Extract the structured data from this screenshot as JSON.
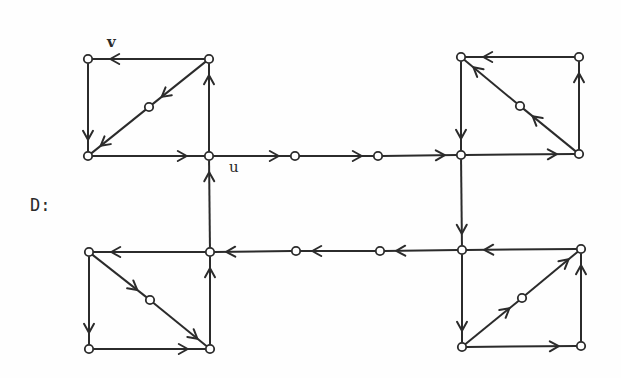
{
  "diagram": {
    "title": "D:",
    "labels": [
      {
        "id": "v",
        "text": "v",
        "x": 107,
        "y": 47
      },
      {
        "id": "u",
        "text": "u",
        "x": 229,
        "y": 172
      }
    ],
    "nodes": [
      {
        "id": "a1",
        "x": 88,
        "y": 59
      },
      {
        "id": "a2",
        "x": 209,
        "y": 59
      },
      {
        "id": "a3",
        "x": 149,
        "y": 107
      },
      {
        "id": "a4",
        "x": 88,
        "y": 156
      },
      {
        "id": "u",
        "x": 209,
        "y": 156
      },
      {
        "id": "m1",
        "x": 295,
        "y": 156
      },
      {
        "id": "m2",
        "x": 378,
        "y": 156
      },
      {
        "id": "b3",
        "x": 461,
        "y": 155
      },
      {
        "id": "b1",
        "x": 461,
        "y": 57
      },
      {
        "id": "b2",
        "x": 579,
        "y": 57
      },
      {
        "id": "b5",
        "x": 520,
        "y": 106
      },
      {
        "id": "b4",
        "x": 579,
        "y": 154
      },
      {
        "id": "c1",
        "x": 462,
        "y": 250
      },
      {
        "id": "c2",
        "x": 581,
        "y": 249
      },
      {
        "id": "c5",
        "x": 522,
        "y": 298
      },
      {
        "id": "c3",
        "x": 462,
        "y": 347
      },
      {
        "id": "c4",
        "x": 581,
        "y": 346
      },
      {
        "id": "m3",
        "x": 380,
        "y": 251
      },
      {
        "id": "m4",
        "x": 296,
        "y": 251
      },
      {
        "id": "d2",
        "x": 210,
        "y": 252
      },
      {
        "id": "d1",
        "x": 89,
        "y": 252
      },
      {
        "id": "d5",
        "x": 150,
        "y": 300
      },
      {
        "id": "d3",
        "x": 89,
        "y": 349
      },
      {
        "id": "d4",
        "x": 210,
        "y": 349
      }
    ],
    "edges": [
      {
        "from": "a2",
        "to": "a1"
      },
      {
        "from": "a1",
        "to": "a4"
      },
      {
        "from": "a2",
        "to": "a3"
      },
      {
        "from": "a3",
        "to": "a4"
      },
      {
        "from": "a4",
        "to": "u"
      },
      {
        "from": "u",
        "to": "a2"
      },
      {
        "from": "u",
        "to": "m1"
      },
      {
        "from": "m1",
        "to": "m2"
      },
      {
        "from": "m2",
        "to": "b3"
      },
      {
        "from": "b1",
        "to": "b3"
      },
      {
        "from": "b3",
        "to": "b4"
      },
      {
        "from": "b4",
        "to": "b2"
      },
      {
        "from": "b2",
        "to": "b1"
      },
      {
        "from": "b4",
        "to": "b5"
      },
      {
        "from": "b5",
        "to": "b1"
      },
      {
        "from": "b3",
        "to": "c1"
      },
      {
        "from": "c2",
        "to": "c1"
      },
      {
        "from": "c1",
        "to": "c3"
      },
      {
        "from": "c3",
        "to": "c4"
      },
      {
        "from": "c4",
        "to": "c2"
      },
      {
        "from": "c3",
        "to": "c5"
      },
      {
        "from": "c5",
        "to": "c2"
      },
      {
        "from": "c1",
        "to": "m3"
      },
      {
        "from": "m3",
        "to": "m4"
      },
      {
        "from": "m4",
        "to": "d2"
      },
      {
        "from": "d2",
        "to": "d1"
      },
      {
        "from": "d1",
        "to": "d3"
      },
      {
        "from": "d3",
        "to": "d4"
      },
      {
        "from": "d1",
        "to": "d5"
      },
      {
        "from": "d5",
        "to": "d4"
      },
      {
        "from": "d4",
        "to": "d2"
      },
      {
        "from": "d2",
        "to": "u"
      }
    ]
  }
}
